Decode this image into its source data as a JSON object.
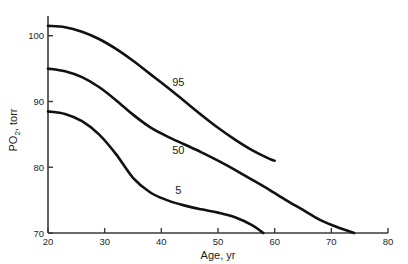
{
  "chart_data": {
    "type": "line",
    "title": "",
    "xlabel": "Age, yr",
    "ylabel": "PO2, torr",
    "ylabel_base": "PO",
    "ylabel_sub": "2",
    "ylabel_rest": ", torr",
    "xlim": [
      20,
      80
    ],
    "ylim": [
      70,
      103
    ],
    "grid": false,
    "legend": "inline-curve-labels",
    "xticks": [
      20,
      30,
      40,
      50,
      60,
      70,
      80
    ],
    "xtick_labels": [
      "20",
      "30",
      "40",
      "50",
      "60",
      "70",
      "80"
    ],
    "yticks": [
      70,
      80,
      90,
      100
    ],
    "ytick_labels": [
      "70",
      "80",
      "90",
      "100"
    ],
    "series": [
      {
        "name": "95",
        "label": "95",
        "label_x": 43,
        "label_y": 93,
        "x": [
          20,
          23,
          26,
          29,
          32,
          35,
          38,
          41,
          44,
          47,
          50,
          53,
          56,
          59,
          60
        ],
        "values": [
          101.5,
          101.3,
          100.6,
          99.5,
          98.0,
          96.2,
          94.2,
          92.2,
          90.1,
          88.0,
          86.0,
          84.2,
          82.6,
          81.3,
          81.0
        ]
      },
      {
        "name": "50",
        "label": "50",
        "label_x": 43,
        "label_y": 82.6,
        "x": [
          20,
          23,
          26,
          29,
          32,
          35,
          38,
          41,
          44,
          47,
          50,
          53,
          56,
          59,
          62,
          65,
          68,
          71,
          74
        ],
        "values": [
          95.0,
          94.6,
          93.7,
          92.2,
          90.2,
          88.0,
          86.1,
          84.7,
          83.5,
          82.3,
          81.0,
          79.6,
          78.1,
          76.6,
          75.0,
          73.5,
          72.0,
          70.9,
          70.0
        ]
      },
      {
        "name": "5",
        "label": "5",
        "label_x": 43,
        "label_y": 76.6,
        "x": [
          20,
          23,
          26,
          29,
          32,
          35,
          38,
          41,
          44,
          47,
          50,
          53,
          56,
          58
        ],
        "values": [
          88.5,
          88.1,
          87.0,
          85.0,
          82.0,
          78.4,
          76.2,
          75.0,
          74.2,
          73.6,
          73.1,
          72.4,
          71.2,
          70.0
        ]
      }
    ]
  }
}
